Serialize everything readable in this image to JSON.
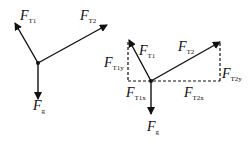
{
  "diagram": {
    "left": {
      "labels": {
        "FT1": {
          "main": "F",
          "sub": "T1"
        },
        "FT2": {
          "main": "F",
          "sub": "T2"
        },
        "Fg": {
          "main": "F",
          "sub": "g"
        }
      }
    },
    "right": {
      "labels": {
        "FT1": {
          "main": "F",
          "sub": "T1"
        },
        "FT2": {
          "main": "F",
          "sub": "T2"
        },
        "Fg": {
          "main": "F",
          "sub": "g"
        },
        "FT1y": {
          "main": "F",
          "sub": "T1y"
        },
        "FT1x": {
          "main": "F",
          "sub": "T1x"
        },
        "FT2y": {
          "main": "F",
          "sub": "T2y"
        },
        "FT2x": {
          "main": "F",
          "sub": "T2x"
        }
      }
    },
    "colors": {
      "stroke": "#111111",
      "background": "#ffffff"
    }
  }
}
